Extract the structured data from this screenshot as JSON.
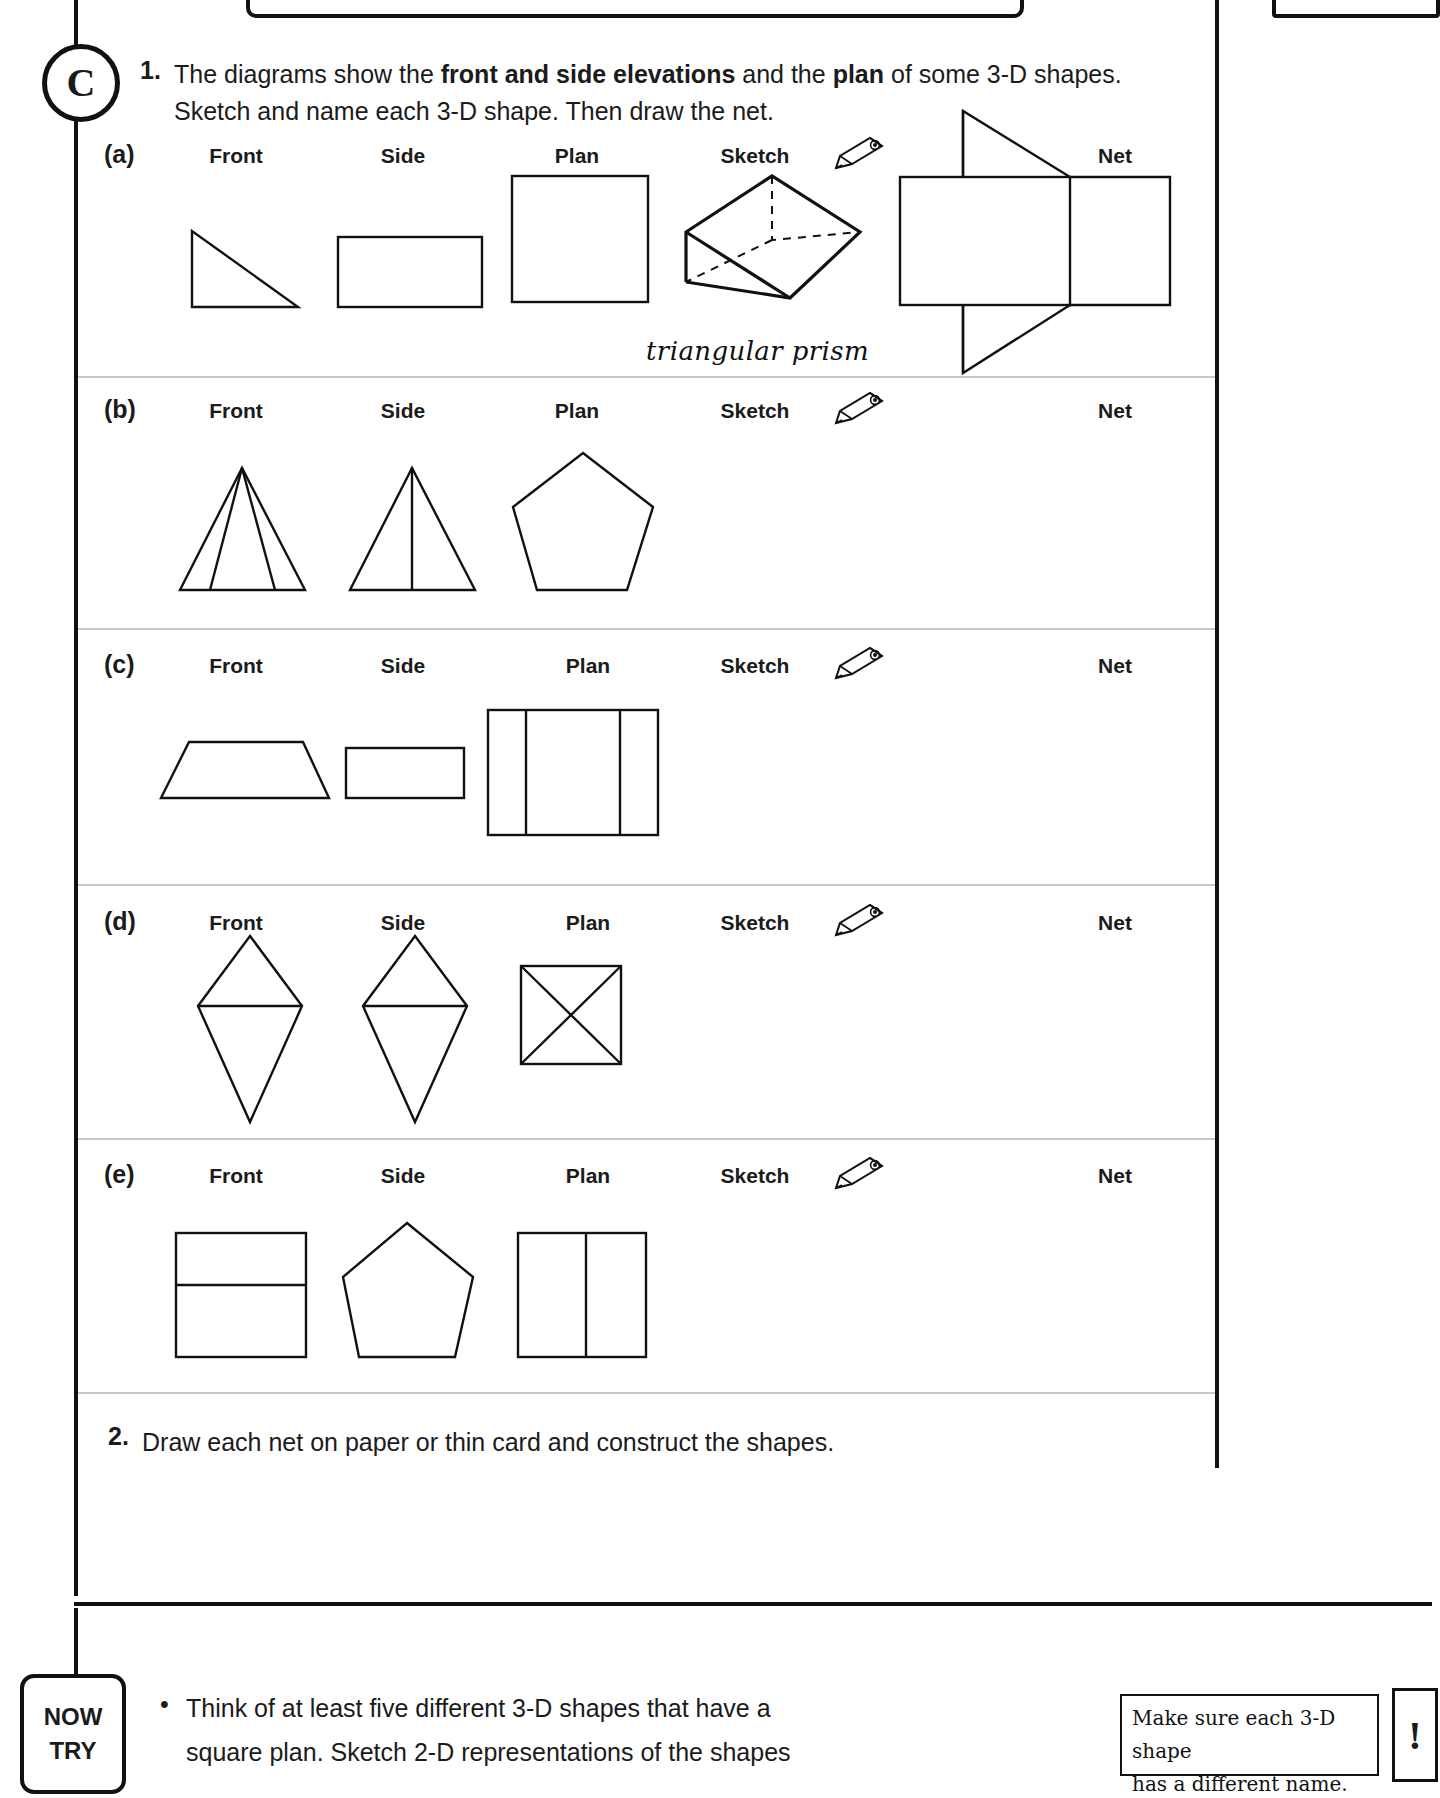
{
  "badge": {
    "letter": "C"
  },
  "questions": {
    "q1": {
      "number": "1.",
      "line1_a": "The diagrams show the ",
      "line1_b": "front and side elevations",
      "line1_c": " and the ",
      "line1_d": "plan",
      "line1_e": " of some 3-D shapes.",
      "line2": "Sketch and name each 3-D shape. Then draw the net."
    },
    "q2": {
      "number": "2.",
      "text": "Draw each net on paper or thin card and construct the shapes."
    }
  },
  "column_headings": {
    "front": "Front",
    "side": "Side",
    "plan": "Plan",
    "sketch": "Sketch",
    "net": "Net"
  },
  "icons": {
    "pencil": "pencil-icon",
    "exclamation": "!"
  },
  "rows": [
    {
      "label": "(a)",
      "front_shape": "right-angled-triangle",
      "side_shape": "rectangle",
      "plan_shape": "square",
      "sketch_shape": "triangular-prism-3d",
      "net_shape": "triangular-prism-net",
      "answer": "triangular prism"
    },
    {
      "label": "(b)",
      "front_shape": "triangle-with-two-internal-lines",
      "side_shape": "triangle-with-one-internal-line",
      "plan_shape": "pentagon",
      "sketch_shape": "",
      "net_shape": "",
      "answer": ""
    },
    {
      "label": "(c)",
      "front_shape": "trapezium",
      "side_shape": "rectangle",
      "plan_shape": "rectangle-three-parts",
      "sketch_shape": "",
      "net_shape": "",
      "answer": ""
    },
    {
      "label": "(d)",
      "front_shape": "octahedron-elevation",
      "side_shape": "octahedron-elevation",
      "plan_shape": "square-with-diagonals",
      "sketch_shape": "",
      "net_shape": "",
      "answer": ""
    },
    {
      "label": "(e)",
      "front_shape": "rectangle-with-horizontal-line",
      "side_shape": "pentagon",
      "plan_shape": "rectangle-two-parts",
      "sketch_shape": "",
      "net_shape": "",
      "answer": ""
    }
  ],
  "now_try": {
    "label_line1": "NOW",
    "label_line2": "TRY",
    "bullet": "•",
    "text_line1": "Think of at least five different 3-D shapes that have a",
    "text_line2": "square plan. Sketch 2-D representations of the shapes"
  },
  "tip": {
    "line1": "Make sure each 3-D shape",
    "line2": "has a different name."
  }
}
